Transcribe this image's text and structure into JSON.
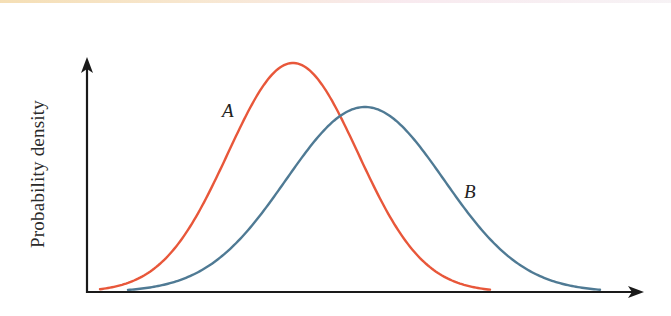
{
  "chart_data": {
    "type": "line",
    "title": "",
    "xlabel": "",
    "ylabel": "Probability density",
    "grid": false,
    "legend": "none (curves labeled inline)",
    "x_axis": {
      "ticks": [],
      "arrow": true
    },
    "y_axis": {
      "ticks": [],
      "arrow": true
    },
    "series": [
      {
        "name": "A",
        "label": "A",
        "color": "#e8573a",
        "distribution": "normal",
        "mean_px": 293,
        "sigma_px": 65,
        "peak_height_px": 229,
        "x_range_px": [
          100,
          490
        ],
        "relative_peak": 1.0
      },
      {
        "name": "B",
        "label": "B",
        "color": "#4f7a94",
        "distribution": "normal",
        "mean_px": 365,
        "sigma_px": 79,
        "peak_height_px": 185,
        "x_range_px": [
          128,
          600
        ],
        "relative_peak": 0.81
      }
    ],
    "annotations": [
      {
        "text": "A",
        "style": "italic",
        "near": "left flank of curve A"
      },
      {
        "text": "B",
        "style": "italic",
        "near": "right flank of curve B"
      }
    ]
  },
  "axes": {
    "origin": [
      87,
      292
    ],
    "y_arrow_tip": [
      87,
      57
    ],
    "x_arrow_tip": [
      644,
      292
    ],
    "color": "#1a1a1a"
  }
}
